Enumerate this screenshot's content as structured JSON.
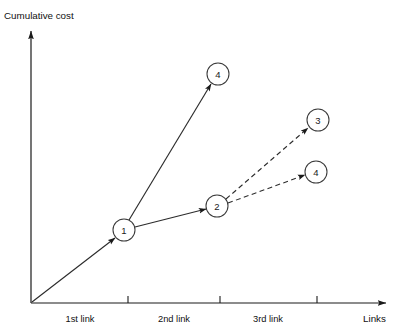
{
  "figure": {
    "type": "diagram",
    "subtype": "node-link cumulative cost graph",
    "background_color": "#ffffff",
    "line_color": "#2b2b2b"
  },
  "axes": {
    "y_axis": {
      "label": "Cumulative cost",
      "label_x": 4,
      "label_y": 19,
      "x": 31,
      "y_top": 28,
      "y_bottom": 303,
      "arrow": "up"
    },
    "x_axis": {
      "label": "Links",
      "label_x": 371,
      "label_y": 320,
      "y": 303,
      "x_left": 31,
      "x_right": 390,
      "arrow": "right",
      "ticks": [
        {
          "x": 128,
          "label": ""
        },
        {
          "x": 220,
          "label": ""
        },
        {
          "x": 317,
          "label": ""
        }
      ],
      "tick_labels": [
        {
          "text": "1st link",
          "x": 80,
          "y": 319
        },
        {
          "text": "2nd link",
          "x": 174,
          "y": 319
        },
        {
          "text": "3rd link",
          "x": 268,
          "y": 319
        }
      ]
    }
  },
  "nodes": [
    {
      "id": "node-1",
      "label": "1",
      "cx": 124,
      "cy": 230,
      "r": 11
    },
    {
      "id": "node-2",
      "label": "2",
      "cx": 217,
      "cy": 206,
      "r": 11
    },
    {
      "id": "node-top-4",
      "label": "4",
      "cx": 218,
      "cy": 74,
      "r": 11
    },
    {
      "id": "node-3",
      "label": "3",
      "cx": 318,
      "cy": 120,
      "r": 11
    },
    {
      "id": "node-right-4",
      "label": "4",
      "cx": 316,
      "cy": 172,
      "r": 11
    }
  ],
  "edges": [
    {
      "id": "edge-origin-to-1",
      "from": "origin",
      "to": "node-1",
      "style": "solid",
      "x1": 32,
      "y1": 302,
      "x2": 115,
      "y2": 238
    },
    {
      "id": "edge-1-to-top-4",
      "from": "node-1",
      "to": "node-top-4",
      "style": "solid",
      "x1": 129,
      "y1": 220,
      "x2": 211,
      "y2": 84
    },
    {
      "id": "edge-1-to-2",
      "from": "node-1",
      "to": "node-2",
      "style": "solid",
      "x1": 135,
      "y1": 227,
      "x2": 206,
      "y2": 209
    },
    {
      "id": "edge-2-to-3",
      "from": "node-2",
      "to": "node-3",
      "style": "dashed",
      "x1": 226,
      "y1": 199,
      "x2": 308,
      "y2": 128
    },
    {
      "id": "edge-2-to-right-4",
      "from": "node-2",
      "to": "node-right-4",
      "style": "dashed",
      "x1": 228,
      "y1": 203,
      "x2": 305,
      "y2": 175
    }
  ]
}
